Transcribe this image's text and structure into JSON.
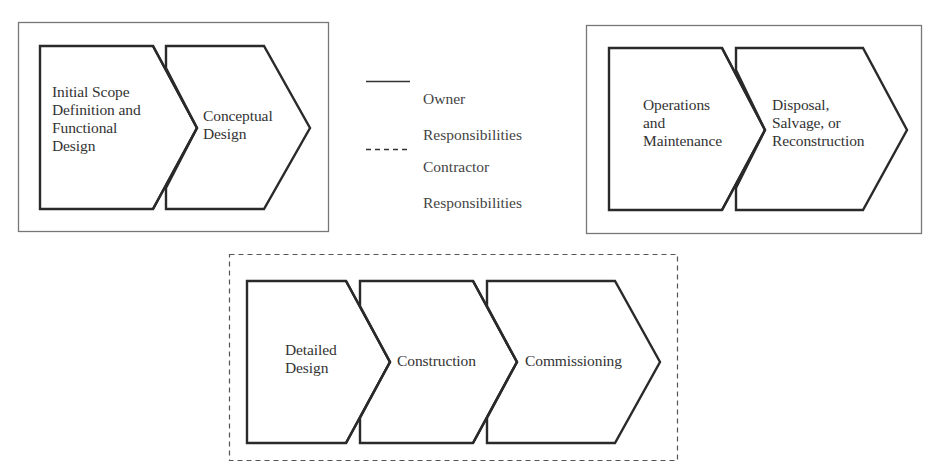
{
  "colors": {
    "stroke": "#2a2a2a",
    "box_border": "#777777",
    "text": "#333333",
    "background": "#ffffff"
  },
  "legend": {
    "items": [
      {
        "style": "solid",
        "line1": "Owner",
        "line2": "Responsibilities"
      },
      {
        "style": "dashed",
        "line1": "Contractor",
        "line2": "Responsibilities"
      }
    ]
  },
  "groups": [
    {
      "id": "owner-front-end",
      "responsibility": "Owner",
      "border": "solid",
      "steps": [
        {
          "label": "Initial Scope\nDefinition and\nFunctional\nDesign"
        },
        {
          "label": "Conceptual\nDesign"
        }
      ]
    },
    {
      "id": "owner-back-end",
      "responsibility": "Owner",
      "border": "solid",
      "steps": [
        {
          "label": "Operations\nand\nMaintenance"
        },
        {
          "label": "Disposal,\nSalvage, or\nReconstruction"
        }
      ]
    },
    {
      "id": "contractor",
      "responsibility": "Contractor",
      "border": "dashed",
      "steps": [
        {
          "label": "Detailed\nDesign"
        },
        {
          "label": "Construction"
        },
        {
          "label": "Commissioning"
        }
      ]
    }
  ]
}
